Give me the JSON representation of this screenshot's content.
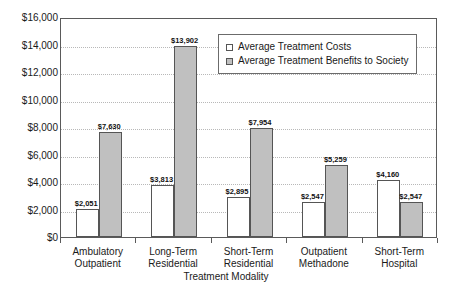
{
  "chart_data": {
    "type": "bar",
    "title": "",
    "xlabel": "Treatment Modality",
    "ylabel": "",
    "ylim": [
      0,
      16000
    ],
    "ytick_step": 2000,
    "ytick_labels": [
      "$0",
      "$2,000",
      "$4,000",
      "$6,000",
      "$8,000",
      "$10,000",
      "$12,000",
      "$14,000",
      "$16,000"
    ],
    "grid": true,
    "legend_position": "upper center",
    "categories": [
      "Ambulatory\nOutpatient",
      "Long-Term\nResidential",
      "Short-Term\nResidential",
      "Outpatient\nMethadone",
      "Short-Term\nHospital"
    ],
    "category_lines": [
      [
        "Ambulatory",
        "Outpatient"
      ],
      [
        "Long-Term",
        "Residential"
      ],
      [
        "Short-Term",
        "Residential"
      ],
      [
        "Outpatient",
        "Methadone"
      ],
      [
        "Short-Term",
        "Hospital"
      ]
    ],
    "series": [
      {
        "name": "Average Treatment Costs",
        "color": "#ffffff",
        "values": [
          2051,
          3813,
          2895,
          2547,
          4160
        ],
        "labels": [
          "$2,051",
          "$3,813",
          "$2,895",
          "$2,547",
          "$4,160"
        ]
      },
      {
        "name": "Average Treatment Benefits to Society",
        "color": "#c0c0c0",
        "values": [
          7630,
          13902,
          7954,
          5259,
          2547
        ],
        "labels": [
          "$7,630",
          "$13,902",
          "$7,954",
          "$5,259",
          "$2,547"
        ]
      }
    ]
  },
  "legend": {
    "items": [
      {
        "label": "Average Treatment Costs",
        "swatch": "costs"
      },
      {
        "label": "Average Treatment Benefits to Society",
        "swatch": "benefits"
      }
    ]
  },
  "axis": {
    "x_title": "Treatment Modality"
  },
  "colors": {
    "bar_costs_fill": "#ffffff",
    "bar_benefits_fill": "#c0c0c0",
    "bar_stroke": "#555555",
    "frame": "#5a5a5a",
    "gridline": "#b8b8b8",
    "text": "#1a1a1a",
    "background": "#ffffff"
  }
}
